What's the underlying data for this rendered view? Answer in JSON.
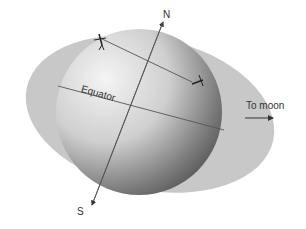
{
  "diagram": {
    "labels": {
      "north": "N",
      "south": "S",
      "equator": "Equator",
      "to_moon": "To moon"
    },
    "colors": {
      "bulge": "#c9c9c9",
      "sphere_light": "#f2f2f2",
      "sphere_dark": "#5a5a5a",
      "lines": "#555555",
      "text": "#333333"
    }
  }
}
